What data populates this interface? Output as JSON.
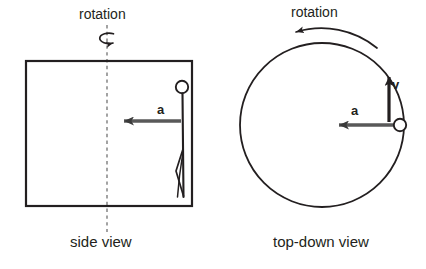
{
  "figure": {
    "background_color": "#ffffff",
    "ink_color": "#231f20",
    "vector_gray": "#595959",
    "width": 426,
    "height": 269
  },
  "panels": {
    "side": {
      "caption": "side view",
      "rotation_label": "rotation",
      "axis_type": "dashed-vertical-rotation-axis",
      "chamber": {
        "shape": "rectangle",
        "x": 26,
        "y": 61,
        "width": 166,
        "height": 145
      },
      "axis_line": {
        "x": 107,
        "y_top": 25,
        "y_bottom": 232
      },
      "rotation_icon": {
        "type": "ellipse-arrow",
        "cx": 105,
        "cy": 38
      },
      "person": {
        "type": "stick-figure",
        "head_cx": 182,
        "head_cy": 87,
        "head_r": 6,
        "body_x": 182,
        "body_y_top": 93,
        "body_y_bottom": 196
      },
      "vectors": [
        {
          "label": "a",
          "meaning": "centripetal-acceleration",
          "color": "#595959",
          "direction": "left",
          "x_start": 181,
          "x_end": 122,
          "y": 121
        }
      ]
    },
    "top": {
      "caption": "top-down view",
      "rotation_label": "rotation",
      "circle": {
        "cx": 322,
        "cy": 125,
        "r": 82
      },
      "rotation_arc": {
        "direction": "counterclockwise",
        "arrowhead_side": "left",
        "cx": 322,
        "cy": 125,
        "r": 97
      },
      "person_marker": {
        "cx": 400,
        "cy": 125,
        "r": 6
      },
      "vectors": [
        {
          "label": "a",
          "meaning": "centripetal-acceleration",
          "color": "#595959",
          "direction": "left",
          "x_start": 394,
          "x_end": 337,
          "y": 125
        },
        {
          "label": "v",
          "meaning": "tangential-velocity",
          "color": "#231f20",
          "direction": "up",
          "x": 389,
          "y_start": 122,
          "y_end": 75
        }
      ]
    }
  }
}
